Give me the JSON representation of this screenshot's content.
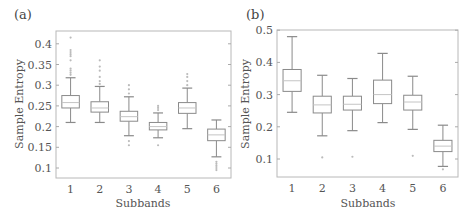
{
  "figure": {
    "panels": [
      "(a)",
      "(b)"
    ]
  },
  "chart_data": [
    {
      "type": "box",
      "panel": "(a)",
      "title": "",
      "xlabel": "Subbands",
      "ylabel": "Sample Entropy",
      "categories": [
        "1",
        "2",
        "3",
        "4",
        "5",
        "6"
      ],
      "yticks": [
        "0.1",
        "0.15",
        "0.2",
        "0.25",
        "0.3",
        "0.35",
        "0.4"
      ],
      "ylim": [
        0.085,
        0.43
      ],
      "boxes": [
        {
          "whisker_low": 0.21,
          "q1": 0.245,
          "median": 0.258,
          "q3": 0.275,
          "whisker_high": 0.318,
          "outliers": [
            0.325,
            0.33,
            0.335,
            0.34,
            0.36,
            0.37,
            0.375,
            0.38,
            0.385,
            0.415
          ]
        },
        {
          "whisker_low": 0.21,
          "q1": 0.235,
          "median": 0.245,
          "q3": 0.26,
          "whisker_high": 0.297,
          "outliers": [
            0.303,
            0.31,
            0.32,
            0.335,
            0.345,
            0.36
          ]
        },
        {
          "whisker_low": 0.178,
          "q1": 0.213,
          "median": 0.224,
          "q3": 0.237,
          "whisker_high": 0.272,
          "outliers": [
            0.165,
            0.155,
            0.28,
            0.29,
            0.3
          ]
        },
        {
          "whisker_low": 0.173,
          "q1": 0.192,
          "median": 0.2,
          "q3": 0.21,
          "whisker_high": 0.233,
          "outliers": [
            0.155,
            0.24,
            0.245,
            0.25
          ]
        },
        {
          "whisker_low": 0.195,
          "q1": 0.232,
          "median": 0.245,
          "q3": 0.258,
          "whisker_high": 0.293,
          "outliers": [
            0.3,
            0.31,
            0.32,
            0.327
          ]
        },
        {
          "whisker_low": 0.127,
          "q1": 0.166,
          "median": 0.18,
          "q3": 0.194,
          "whisker_high": 0.216,
          "outliers": [
            0.115,
            0.11,
            0.105,
            0.1,
            0.095
          ]
        }
      ],
      "grid": false
    },
    {
      "type": "box",
      "panel": "(b)",
      "title": "",
      "xlabel": "Subbands",
      "ylabel": "Sample Entropy",
      "categories": [
        "1",
        "2",
        "3",
        "4",
        "5",
        "6"
      ],
      "yticks": [
        "0.1",
        "0.2",
        "0.3",
        "0.4",
        "0.5"
      ],
      "ylim": [
        0.045,
        0.5
      ],
      "boxes": [
        {
          "whisker_low": 0.245,
          "q1": 0.31,
          "median": 0.343,
          "q3": 0.378,
          "whisker_high": 0.48,
          "outliers": []
        },
        {
          "whisker_low": 0.172,
          "q1": 0.243,
          "median": 0.268,
          "q3": 0.295,
          "whisker_high": 0.36,
          "outliers": [
            0.105
          ]
        },
        {
          "whisker_low": 0.188,
          "q1": 0.252,
          "median": 0.27,
          "q3": 0.295,
          "whisker_high": 0.35,
          "outliers": [
            0.107
          ]
        },
        {
          "whisker_low": 0.213,
          "q1": 0.272,
          "median": 0.3,
          "q3": 0.345,
          "whisker_high": 0.428,
          "outliers": []
        },
        {
          "whisker_low": 0.192,
          "q1": 0.252,
          "median": 0.277,
          "q3": 0.298,
          "whisker_high": 0.357,
          "outliers": [
            0.11
          ]
        },
        {
          "whisker_low": 0.077,
          "q1": 0.123,
          "median": 0.14,
          "q3": 0.158,
          "whisker_high": 0.205,
          "outliers": [
            0.068
          ]
        }
      ],
      "grid": false
    }
  ]
}
